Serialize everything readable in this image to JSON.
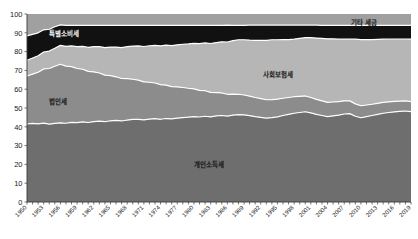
{
  "chart_data": {
    "type": "area",
    "stacked": true,
    "normalized_percent": true,
    "title": "",
    "subtitle": "",
    "xlabel": "",
    "ylabel": "",
    "ylim": [
      0,
      100
    ],
    "ytick_step": 10,
    "yticks": [
      0,
      10,
      20,
      30,
      40,
      50,
      60,
      70,
      80,
      90,
      100
    ],
    "xlim": [
      1950,
      2019
    ],
    "grid": false,
    "legend_position": "inline-annotations",
    "annotations": [
      {
        "text": "특별소비세",
        "x_px": 64,
        "y_px": 36,
        "on_dark": true
      },
      {
        "text": "법인세",
        "x_px": 58,
        "y_px": 104,
        "on_dark": false
      },
      {
        "text": "사회보험세",
        "x_px": 278,
        "y_px": 77,
        "on_dark": false
      },
      {
        "text": "기타 세금",
        "x_px": 364,
        "y_px": 25,
        "on_dark": false
      },
      {
        "text": "개인소득세",
        "x_px": 209,
        "y_px": 167,
        "on_dark": false
      }
    ],
    "x": [
      1950,
      1951,
      1952,
      1953,
      1954,
      1955,
      1956,
      1957,
      1958,
      1959,
      1960,
      1961,
      1962,
      1963,
      1964,
      1965,
      1966,
      1967,
      1968,
      1969,
      1970,
      1971,
      1972,
      1973,
      1974,
      1975,
      1976,
      1977,
      1978,
      1979,
      1980,
      1981,
      1982,
      1983,
      1984,
      1985,
      1986,
      1987,
      1988,
      1989,
      1990,
      1991,
      1992,
      1993,
      1994,
      1995,
      1996,
      1997,
      1998,
      1999,
      2000,
      2001,
      2002,
      2003,
      2004,
      2005,
      2006,
      2007,
      2008,
      2009,
      2010,
      2011,
      2012,
      2013,
      2014,
      2015,
      2016,
      2017,
      2018,
      2019
    ],
    "xtick_labels": [
      "1950",
      "1953",
      "1956",
      "1959",
      "1962",
      "1965",
      "1968",
      "1971",
      "1974",
      "1977",
      "1980",
      "1983",
      "1986",
      "1989",
      "1992",
      "1995",
      "1998",
      "2001",
      "2004",
      "2007",
      "2010",
      "2013",
      "2016",
      "2019"
    ],
    "xtick_label_rotation": 45,
    "xtick_interval_years": 3,
    "xtick_minor_interval_years": 1,
    "series": [
      {
        "name": "개인소득세",
        "color": "#6e6e6e",
        "order": 1,
        "values": [
          41.5,
          41.8,
          41.6,
          42.0,
          41.4,
          41.8,
          42.1,
          41.9,
          42.4,
          42.2,
          42.6,
          42.3,
          42.8,
          43.0,
          42.7,
          43.2,
          43.4,
          43.1,
          43.6,
          43.9,
          44.0,
          43.7,
          44.1,
          44.3,
          44.0,
          44.4,
          44.2,
          44.6,
          44.9,
          45.1,
          45.4,
          45.2,
          45.6,
          45.3,
          45.8,
          46.0,
          45.7,
          46.2,
          46.5,
          46.3,
          45.9,
          45.4,
          45.0,
          44.6,
          44.9,
          45.3,
          46.0,
          46.6,
          47.2,
          47.6,
          48.0,
          47.4,
          46.6,
          46.0,
          45.4,
          45.8,
          46.2,
          46.8,
          47.0,
          45.6,
          44.8,
          45.4,
          46.0,
          46.6,
          47.2,
          47.6,
          47.9,
          48.2,
          48.4,
          48.1
        ]
      },
      {
        "name": "법인세",
        "color": "#8c8c8c",
        "order": 2,
        "values": [
          25.5,
          26.2,
          27.4,
          28.8,
          29.6,
          30.4,
          31.2,
          30.4,
          29.6,
          28.8,
          28.0,
          27.2,
          26.4,
          25.6,
          24.8,
          24.0,
          23.2,
          22.6,
          22.0,
          21.4,
          20.8,
          20.2,
          19.6,
          19.0,
          18.4,
          17.8,
          17.2,
          16.6,
          16.0,
          15.4,
          14.8,
          14.2,
          13.6,
          13.0,
          12.4,
          12.0,
          11.6,
          11.2,
          10.8,
          10.6,
          10.4,
          10.2,
          10.0,
          9.8,
          9.6,
          9.4,
          9.2,
          9.0,
          8.8,
          8.6,
          8.4,
          8.2,
          8.0,
          7.8,
          7.6,
          7.4,
          7.2,
          7.0,
          6.8,
          6.6,
          6.4,
          6.2,
          6.0,
          5.9,
          5.8,
          5.7,
          5.6,
          5.5,
          5.4,
          5.3
        ]
      },
      {
        "name": "사회보험세",
        "color": "#b6b6b6",
        "order": 3,
        "values": [
          8.4,
          8.6,
          8.8,
          9.0,
          9.3,
          9.6,
          10.0,
          10.5,
          11.0,
          11.6,
          12.2,
          12.8,
          13.4,
          14.0,
          14.6,
          15.2,
          15.8,
          16.4,
          17.0,
          17.6,
          18.2,
          18.8,
          19.4,
          20.0,
          20.6,
          21.2,
          21.8,
          22.4,
          23.0,
          23.6,
          24.2,
          24.8,
          25.4,
          26.0,
          26.6,
          27.2,
          27.8,
          28.4,
          29.0,
          29.4,
          29.8,
          30.4,
          31.0,
          31.6,
          31.8,
          31.6,
          31.2,
          30.8,
          30.6,
          30.8,
          31.0,
          31.8,
          32.6,
          33.2,
          33.8,
          33.6,
          33.2,
          32.8,
          32.8,
          34.4,
          35.2,
          34.8,
          34.4,
          34.0,
          33.6,
          33.4,
          33.2,
          33.0,
          32.9,
          33.2
        ]
      },
      {
        "name": "특별소비세",
        "color": "#111111",
        "order": 4,
        "values": [
          13.0,
          12.6,
          12.2,
          11.8,
          11.6,
          11.4,
          10.9,
          11.2,
          11.0,
          11.4,
          11.2,
          11.7,
          11.4,
          11.4,
          11.9,
          11.6,
          11.6,
          11.9,
          11.4,
          11.1,
          10.9,
          11.3,
          10.9,
          10.7,
          11.0,
          10.6,
          10.8,
          10.4,
          10.1,
          9.9,
          9.6,
          9.8,
          9.4,
          9.7,
          9.2,
          8.8,
          9.0,
          8.2,
          7.7,
          7.7,
          8.0,
          8.1,
          8.1,
          8.1,
          7.8,
          7.8,
          7.7,
          7.7,
          7.5,
          7.1,
          6.7,
          6.7,
          6.9,
          6.9,
          7.1,
          7.1,
          7.3,
          7.3,
          7.3,
          7.3,
          7.5,
          7.5,
          7.5,
          7.4,
          7.3,
          7.2,
          7.2,
          7.2,
          7.2,
          7.3
        ]
      },
      {
        "name": "기타 세금",
        "color": "#a0a0a0",
        "order": 5,
        "values": [
          11.6,
          10.8,
          10.0,
          8.4,
          8.1,
          6.8,
          5.8,
          6.0,
          6.0,
          6.0,
          6.0,
          6.0,
          6.0,
          6.0,
          6.0,
          6.0,
          6.0,
          6.0,
          6.0,
          6.0,
          6.1,
          6.0,
          6.0,
          6.0,
          6.0,
          6.0,
          6.0,
          6.0,
          6.0,
          6.0,
          6.0,
          6.0,
          6.0,
          6.0,
          6.0,
          6.0,
          5.9,
          6.0,
          6.0,
          6.0,
          5.9,
          5.9,
          5.9,
          5.9,
          5.9,
          5.9,
          5.9,
          5.9,
          5.9,
          5.9,
          5.9,
          5.9,
          5.9,
          6.1,
          6.1,
          6.1,
          6.1,
          6.1,
          6.1,
          6.1,
          6.1,
          6.1,
          6.1,
          6.1,
          6.1,
          6.1,
          6.1,
          6.1,
          6.1,
          6.1
        ]
      }
    ]
  }
}
